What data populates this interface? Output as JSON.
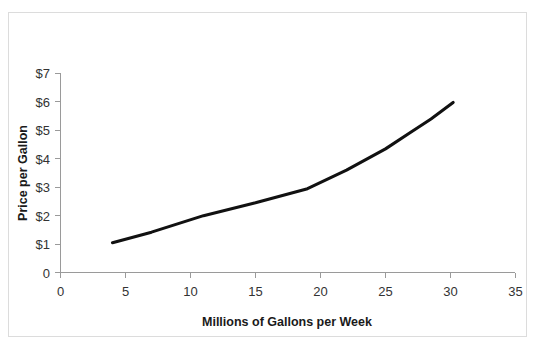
{
  "chart_data": {
    "type": "line",
    "title": "",
    "xlabel": "Millions of Gallons per Week",
    "ylabel": "Price per Gallon",
    "xlim": [
      0,
      35
    ],
    "ylim": [
      0,
      7
    ],
    "xticks": [
      0,
      5,
      10,
      15,
      20,
      25,
      30,
      35
    ],
    "xticklabels": [
      "0",
      "5",
      "10",
      "15",
      "20",
      "25",
      "30",
      "35"
    ],
    "yticks": [
      0,
      1,
      2,
      3,
      4,
      5,
      6,
      7
    ],
    "yticklabels": [
      "0",
      "$1",
      "$2",
      "$3",
      "$4",
      "$5",
      "$6",
      "$7"
    ],
    "grid": false,
    "legend": null,
    "series": [
      {
        "name": "Supply",
        "color": "#111111",
        "x": [
          4.0,
          7.0,
          11.0,
          15.0,
          19.0,
          22.0,
          25.0,
          27.0,
          28.5,
          30.2
        ],
        "y": [
          1.05,
          1.42,
          2.0,
          2.45,
          2.95,
          3.6,
          4.35,
          4.95,
          5.4,
          5.98
        ]
      }
    ]
  },
  "axis": {
    "x_tick_labels": [
      "0",
      "5",
      "10",
      "15",
      "20",
      "25",
      "30",
      "35"
    ],
    "y_tick_labels": [
      "$7",
      "$6",
      "$5",
      "$4",
      "$3",
      "$2",
      "$1",
      "0"
    ],
    "x_title": "Millions of Gallons per Week",
    "y_title": "Price per Gallon"
  },
  "colors": {
    "line": "#111111",
    "axis": "#9a9a9a",
    "frame": "#dcdcdc",
    "text": "#1a1a1a",
    "background": "#ffffff"
  }
}
